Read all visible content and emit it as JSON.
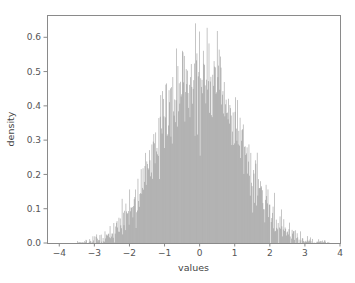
{
  "figure": {
    "background_color": "#ffffff",
    "plot_area": {
      "left": 47,
      "top": 15,
      "right": 340,
      "bottom": 243
    }
  },
  "chart_data": {
    "type": "bar",
    "title": "",
    "subtitle": "",
    "xlabel": "values",
    "ylabel": "density",
    "xlim": [
      -4.35,
      4.0
    ],
    "ylim": [
      0.0,
      0.665
    ],
    "xticks": [
      -4,
      -3,
      -2,
      -1,
      0,
      1,
      2,
      3,
      4
    ],
    "xticklabels": [
      "−4",
      "−3",
      "−2",
      "−1",
      "0",
      "1",
      "2",
      "3",
      "4"
    ],
    "yticks": [
      0.0,
      0.1,
      0.2,
      0.3,
      0.4,
      0.5,
      0.6
    ],
    "yticklabels": [
      "0.0",
      "0.1",
      "0.2",
      "0.3",
      "0.4",
      "0.5",
      "0.6"
    ],
    "grid": false,
    "legend": null,
    "bar_color": "#808080",
    "edge_color": "#808080",
    "spine_color": "#8a8a8a",
    "tick_label_color": "#555555",
    "axis_label_color": "#444444",
    "distribution": "standard normal",
    "mean": 0.0,
    "std": 1.0,
    "n_bins": 400,
    "bin_width": 0.0185,
    "data_min": -3.52,
    "data_max": 3.71,
    "peak_density": 0.56,
    "categories": [
      -3.5,
      -3.4,
      -3.3,
      -3.2,
      -3.1,
      -3.0,
      -2.9,
      -2.8,
      -2.7,
      -2.6,
      -2.5,
      -2.4,
      -2.3,
      -2.2,
      -2.1,
      -2.0,
      -1.9,
      -1.8,
      -1.7,
      -1.6,
      -1.5,
      -1.4,
      -1.3,
      -1.2,
      -1.1,
      -1.0,
      -0.9,
      -0.8,
      -0.7,
      -0.6,
      -0.5,
      -0.4,
      -0.3,
      -0.2,
      -0.1,
      0.0,
      0.1,
      0.2,
      0.3,
      0.4,
      0.5,
      0.6,
      0.7,
      0.8,
      0.9,
      1.0,
      1.1,
      1.2,
      1.3,
      1.4,
      1.5,
      1.6,
      1.7,
      1.8,
      1.9,
      2.0,
      2.1,
      2.2,
      2.3,
      2.4,
      2.5,
      2.6,
      2.7,
      2.8,
      2.9,
      3.0,
      3.1,
      3.2,
      3.3,
      3.4,
      3.5,
      3.6,
      3.7
    ],
    "values": [
      0.001,
      0.002,
      0.003,
      0.004,
      0.006,
      0.008,
      0.011,
      0.015,
      0.02,
      0.026,
      0.033,
      0.042,
      0.052,
      0.064,
      0.078,
      0.094,
      0.112,
      0.132,
      0.154,
      0.178,
      0.204,
      0.231,
      0.26,
      0.289,
      0.318,
      0.347,
      0.374,
      0.4,
      0.423,
      0.442,
      0.458,
      0.47,
      0.478,
      0.483,
      0.486,
      0.487,
      0.486,
      0.483,
      0.478,
      0.47,
      0.458,
      0.442,
      0.423,
      0.4,
      0.374,
      0.347,
      0.318,
      0.289,
      0.26,
      0.231,
      0.204,
      0.178,
      0.154,
      0.132,
      0.112,
      0.094,
      0.078,
      0.064,
      0.052,
      0.042,
      0.033,
      0.026,
      0.02,
      0.015,
      0.011,
      0.008,
      0.006,
      0.004,
      0.003,
      0.002,
      0.0015,
      0.001,
      0.0008
    ]
  }
}
